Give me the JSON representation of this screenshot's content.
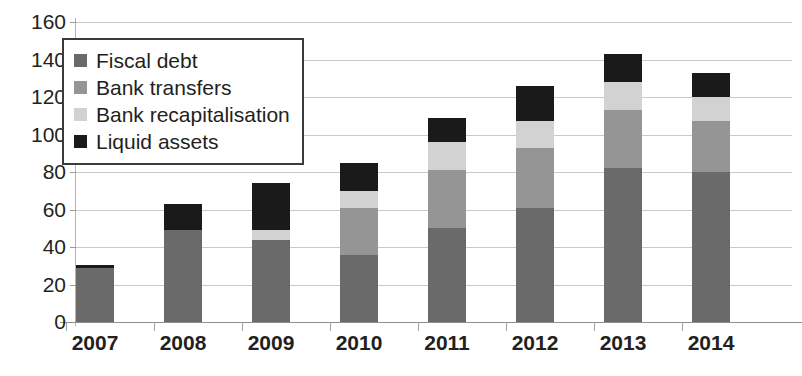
{
  "chart_data": {
    "type": "bar",
    "stacked": true,
    "title": "",
    "xlabel": "",
    "ylabel": "",
    "ylim": [
      0,
      160
    ],
    "ytick_step": 20,
    "yticks": [
      "160",
      "140",
      "120",
      "100",
      "80",
      "60",
      "40",
      "20",
      "0"
    ],
    "grid": true,
    "legend_position": "top-left-inside",
    "categories": [
      "2007",
      "2008",
      "2009",
      "2010",
      "2011",
      "2012",
      "2013",
      "2014"
    ],
    "series": [
      {
        "name": "Fiscal debt",
        "color": "#6a6a6a",
        "values": [
          29,
          49,
          43.5,
          36,
          50,
          61,
          82,
          80
        ]
      },
      {
        "name": "Bank transfers",
        "color": "#959595",
        "values": [
          0,
          0,
          0,
          25,
          31,
          32,
          31,
          27
        ]
      },
      {
        "name": "Bank recapitalisation",
        "color": "#d2d2d2",
        "values": [
          0,
          0,
          5.5,
          9,
          15,
          14,
          15,
          13
        ]
      },
      {
        "name": "Liquid assets",
        "color": "#1a1a1a",
        "values": [
          1.5,
          14,
          25,
          15,
          13,
          19,
          15,
          13
        ]
      }
    ],
    "totals": [
      30.5,
      63,
      74,
      85,
      109,
      126,
      143,
      133
    ]
  },
  "legend": {
    "items": [
      {
        "label": "Fiscal debt",
        "color": "#6a6a6a"
      },
      {
        "label": "Bank transfers",
        "color": "#959595"
      },
      {
        "label": "Bank recapitalisation",
        "color": "#d2d2d2"
      },
      {
        "label": "Liquid assets",
        "color": "#1a1a1a"
      }
    ]
  }
}
